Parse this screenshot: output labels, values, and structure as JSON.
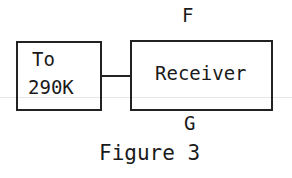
{
  "diagram": {
    "top_label": "F",
    "bottom_label": "G",
    "blocks": [
      {
        "id": "source",
        "lines": [
          "To",
          "290K"
        ]
      },
      {
        "id": "receiver",
        "lines": [
          "Receiver"
        ]
      }
    ],
    "connections": [
      {
        "from": "source",
        "to": "receiver"
      }
    ],
    "caption": "Figure 3"
  }
}
